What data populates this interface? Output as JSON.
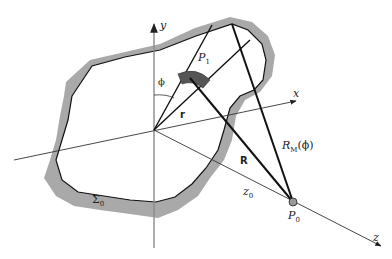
{
  "diagram": {
    "type": "geometry-figure",
    "labels": {
      "y_axis": "y",
      "x_axis": "x",
      "z_axis": "z",
      "phi": "ϕ",
      "p1": "P",
      "p1_sub": "1",
      "r": "r",
      "R": "R",
      "RM": "R",
      "RM_sub": "M",
      "RM_arg": "(ϕ)",
      "z0": "z",
      "z0_sub": "0",
      "p0": "P",
      "p0_sub": "0",
      "sigma0": "Σ",
      "sigma0_sub": "0"
    },
    "colors": {
      "surface_fill": "#a9a9a9",
      "line": "#111111",
      "axis": "#444444",
      "y_axis": "#888888",
      "p1_patch": "#555555"
    }
  }
}
